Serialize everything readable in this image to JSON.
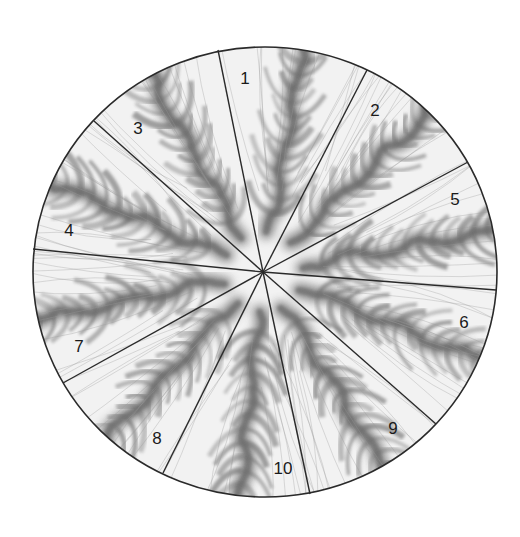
{
  "figure": {
    "type": "segmented-disc",
    "background_color": "#ffffff",
    "disc_fill": "#f2f2f2",
    "band_color": "#6e6e6e",
    "line_color": "#2a2a2a",
    "center": {
      "x": 263,
      "y": 272
    },
    "radius_x": 232,
    "radius_y": 225,
    "disc_center": {
      "x": 265,
      "y": 272
    }
  },
  "divider_lines": [
    {
      "id": "A",
      "x": 218,
      "y": 50
    },
    {
      "id": "B",
      "x": 367,
      "y": 70
    },
    {
      "id": "C",
      "x": 468,
      "y": 162
    },
    {
      "id": "D",
      "x": 496,
      "y": 290
    },
    {
      "id": "E",
      "x": 436,
      "y": 424
    },
    {
      "id": "F",
      "x": 310,
      "y": 494
    },
    {
      "id": "G",
      "x": 163,
      "y": 473
    },
    {
      "id": "H",
      "x": 63,
      "y": 383
    },
    {
      "id": "I",
      "x": 33,
      "y": 249
    },
    {
      "id": "J",
      "x": 94,
      "y": 121
    }
  ],
  "sectors": [
    {
      "label": "3",
      "mid_angle": -120,
      "label_pos": {
        "x": 138,
        "y": 134
      }
    },
    {
      "label": "1",
      "mid_angle": -80,
      "label_pos": {
        "x": 245,
        "y": 84
      }
    },
    {
      "label": "2",
      "mid_angle": -44,
      "label_pos": {
        "x": 375,
        "y": 116
      }
    },
    {
      "label": "5",
      "mid_angle": -10,
      "label_pos": {
        "x": 455,
        "y": 205
      }
    },
    {
      "label": "6",
      "mid_angle": 22,
      "label_pos": {
        "x": 464,
        "y": 328
      }
    },
    {
      "label": "9",
      "mid_angle": 58,
      "label_pos": {
        "x": 393,
        "y": 434
      }
    },
    {
      "label": "10",
      "mid_angle": 96,
      "label_pos": {
        "x": 283,
        "y": 474
      }
    },
    {
      "label": "8",
      "mid_angle": 133,
      "label_pos": {
        "x": 157,
        "y": 444
      }
    },
    {
      "label": "7",
      "mid_angle": 168,
      "label_pos": {
        "x": 79,
        "y": 352
      }
    },
    {
      "label": "4",
      "mid_angle": 203,
      "label_pos": {
        "x": 69,
        "y": 236
      }
    }
  ]
}
